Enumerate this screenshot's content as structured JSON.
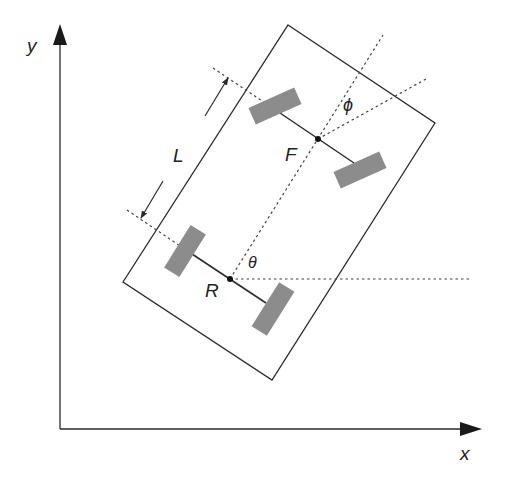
{
  "diagram": {
    "axes": {
      "x_label": "x",
      "y_label": "y"
    },
    "points": {
      "rear": "R",
      "front": "F"
    },
    "labels": {
      "wheelbase": "L",
      "heading_angle": "θ",
      "steering_angle": "ϕ"
    },
    "colors": {
      "line": "#2a2a2a",
      "wheel": "#8c8c8c",
      "dotted": "#444444"
    }
  }
}
